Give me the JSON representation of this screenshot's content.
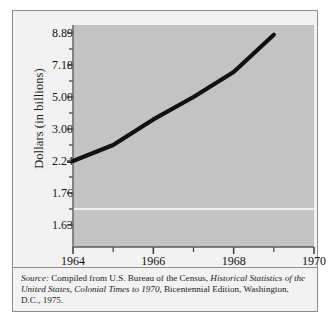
{
  "figure": {
    "background_color": "#f2f2f2",
    "plot_fill_color": "#c3c3c3",
    "line_color": "#111111",
    "border_color": "#8e8e8e",
    "reference_line_color": "#ffffff"
  },
  "axes": {
    "y_title": "Dollars (in billions)",
    "y_tick_labels": [
      "8.89",
      "7.18",
      "5.00",
      "3.00",
      "2.24",
      "1.76",
      "1.63"
    ],
    "x_tick_labels": [
      "1964",
      "1966",
      "1968",
      "1970"
    ]
  },
  "source": {
    "label": "Source:",
    "line1_rest": " Compiled from U.S. Bureau of the Census, ",
    "line1_italic": "Historical Statistics",
    "line2_italic": "of the United States, Colonial Times to 1970,",
    "line2_rest": " Bicentennial Edition,",
    "line3": "Washington, D.C., 1975."
  },
  "chart_data": {
    "type": "line",
    "title": "",
    "xlabel": "",
    "ylabel": "Dollars (in billions)",
    "xlim": [
      1964,
      1970
    ],
    "x_major_ticks": [
      1964,
      1966,
      1968,
      1970
    ],
    "x_minor_ticks": [
      1965,
      1967,
      1969
    ],
    "y_tick_values": [
      8.89,
      7.18,
      5.0,
      3.0,
      2.24,
      1.76,
      1.63
    ],
    "y_axis_scale": "nonlinear-equal-spaced",
    "grid": false,
    "legend": null,
    "reference_line_y": 1.695,
    "series": [
      {
        "name": "Dollars (in billions)",
        "x": [
          1964,
          1965,
          1966,
          1967,
          1968,
          1969
        ],
        "values": [
          2.24,
          2.62,
          3.6,
          5.0,
          6.7,
          8.8
        ]
      }
    ]
  }
}
